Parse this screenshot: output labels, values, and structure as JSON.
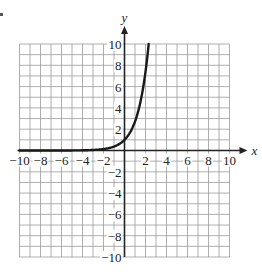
{
  "chart_data": {
    "type": "line",
    "title": "",
    "xlabel": "x",
    "ylabel": "y",
    "xlim": [
      -10,
      10
    ],
    "ylim": [
      -10,
      10
    ],
    "grid": true,
    "grid_step": 1,
    "x_ticks": [
      -10,
      -8,
      -6,
      -4,
      -2,
      2,
      4,
      6,
      8,
      10
    ],
    "y_ticks": [
      -10,
      -8,
      -6,
      -4,
      -2,
      2,
      4,
      6,
      8,
      10
    ],
    "x_tick_labels": [
      "−10",
      "−8",
      "−6",
      "−4",
      "−2",
      "2",
      "4",
      "6",
      "8",
      "10"
    ],
    "y_tick_labels": [
      "−10",
      "−8",
      "−6",
      "−4",
      "−2",
      "2",
      "4",
      "6",
      "8",
      "10"
    ],
    "legend": [],
    "series": [
      {
        "name": "exponential curve",
        "function": "y = e^x",
        "x": [
          -10,
          -6,
          -4,
          -3,
          -2,
          -1,
          0,
          0.5,
          1,
          1.5,
          2,
          2.3
        ],
        "y": [
          0.0,
          0.0,
          0.02,
          0.05,
          0.14,
          0.37,
          1,
          1.65,
          2.72,
          4.48,
          7.39,
          9.97
        ],
        "color": "#1a1a1a"
      }
    ]
  }
}
